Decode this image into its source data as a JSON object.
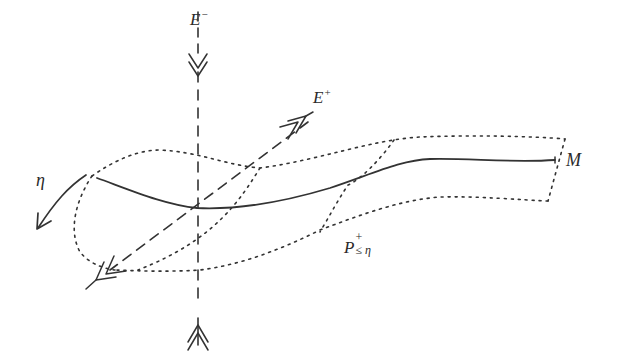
{
  "diagram": {
    "labels": {
      "e_minus": {
        "base": "E",
        "sup": "−"
      },
      "e_plus": {
        "base": "E",
        "sup": "+"
      },
      "eta": {
        "text": "η"
      },
      "manifold": {
        "text": "M"
      },
      "region": {
        "base": "P",
        "sup": "+",
        "sub": "≤ η"
      }
    },
    "colors": {
      "stroke": "#333333",
      "background": "#ffffff"
    },
    "elements": [
      "vertical dashed line E− (stable direction) with double-chevron arrows pointing toward the curve from top and bottom",
      "diagonal dashed line E+ (unstable direction) with double arrows pointing outward",
      "solid curve M",
      "dotted tubular neighborhood P+≤η around M",
      "curved arrow labeled η"
    ]
  }
}
